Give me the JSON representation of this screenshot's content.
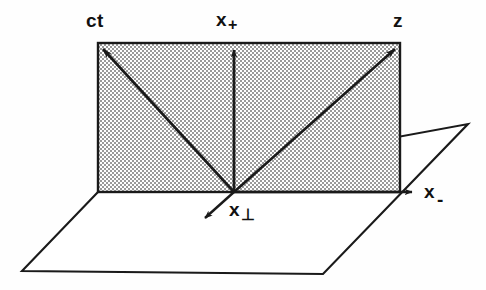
{
  "figure": {
    "background_color": "#fefefe",
    "line_color": "#1a1a1a",
    "shade_color": "#c9c9c9"
  },
  "labels": {
    "ct": {
      "base": "ct",
      "sub": ""
    },
    "x_plus": {
      "base": "x",
      "sub": "+"
    },
    "z": {
      "base": "z",
      "sub": ""
    },
    "x_minus": {
      "base": "x",
      "sub": "-"
    },
    "x_perp": {
      "base": "x",
      "sub": "⊥"
    }
  },
  "geometry": {
    "origin": {
      "x": 234,
      "y": 192
    },
    "shaded_rect": {
      "left": 98,
      "top": 43,
      "right": 400,
      "bottom": 192
    },
    "ground_plane": [
      {
        "x": 98,
        "y": 192
      },
      {
        "x": 468,
        "y": 124
      },
      {
        "x": 323,
        "y": 274
      },
      {
        "x": 22,
        "y": 271
      }
    ],
    "arrows": [
      {
        "name": "ct",
        "from": {
          "x": 234,
          "y": 192
        },
        "to": {
          "x": 99,
          "y": 45
        }
      },
      {
        "name": "x_plus",
        "from": {
          "x": 234,
          "y": 192
        },
        "to": {
          "x": 234,
          "y": 45
        }
      },
      {
        "name": "z",
        "from": {
          "x": 234,
          "y": 192
        },
        "to": {
          "x": 399,
          "y": 45
        }
      },
      {
        "name": "x_minus",
        "from": {
          "x": 234,
          "y": 192
        },
        "to": {
          "x": 417,
          "y": 192
        }
      },
      {
        "name": "x_perp",
        "from": {
          "x": 234,
          "y": 192
        },
        "to": {
          "x": 201,
          "y": 222
        }
      }
    ]
  }
}
